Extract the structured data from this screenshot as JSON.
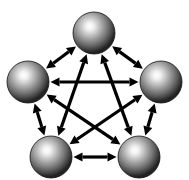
{
  "figure": {
    "title": "Complete graph K5 with bidirectional links",
    "type": "node-link-diagram",
    "width": 189,
    "height": 180,
    "background_color": "#ffffff",
    "node_count": 5,
    "edge_count": 10,
    "edge_direction": "bidirectional"
  },
  "style": {
    "edge_color": "#000000",
    "edge_width": 3.2,
    "arrowhead_length": 9,
    "arrowhead_half_width": 4.6,
    "sphere_radius": 21,
    "sphere_highlight_color": "#ffffff",
    "sphere_mid_color": "#8e8e8e",
    "sphere_edge_color": "#232323",
    "sphere_rim_color": "#141414",
    "sphere_highlight_cx": "40%",
    "sphere_highlight_cy": "34%"
  },
  "chart_data": {
    "type": "graph",
    "title": "Complete graph K5 with bidirectional links",
    "layout": "pentagon",
    "directed": "both",
    "nodes": [
      {
        "id": "top",
        "label": "",
        "x": 94,
        "y": 33,
        "r": 21
      },
      {
        "id": "right",
        "label": "",
        "x": 161,
        "y": 82,
        "r": 21
      },
      {
        "id": "bottom-right",
        "label": "",
        "x": 139,
        "y": 157,
        "r": 21
      },
      {
        "id": "bottom-left",
        "label": "",
        "x": 51,
        "y": 157,
        "r": 21
      },
      {
        "id": "left",
        "label": "",
        "x": 28,
        "y": 82,
        "r": 21
      }
    ],
    "edges": [
      {
        "source": "top",
        "target": "right",
        "kind": "side"
      },
      {
        "source": "right",
        "target": "bottom-right",
        "kind": "side"
      },
      {
        "source": "bottom-right",
        "target": "bottom-left",
        "kind": "side"
      },
      {
        "source": "bottom-left",
        "target": "left",
        "kind": "side"
      },
      {
        "source": "left",
        "target": "top",
        "kind": "side"
      },
      {
        "source": "top",
        "target": "bottom-right",
        "kind": "diagonal"
      },
      {
        "source": "top",
        "target": "bottom-left",
        "kind": "diagonal"
      },
      {
        "source": "right",
        "target": "bottom-left",
        "kind": "diagonal"
      },
      {
        "source": "right",
        "target": "left",
        "kind": "diagonal"
      },
      {
        "source": "bottom-right",
        "target": "left",
        "kind": "diagonal"
      }
    ]
  }
}
